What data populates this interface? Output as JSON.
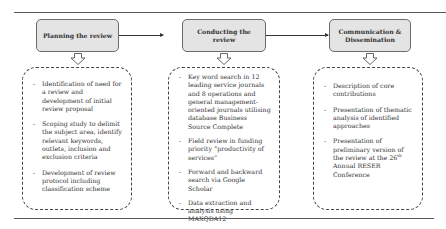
{
  "figure": {
    "phases": [
      {
        "id": "planning",
        "title": "Planning the review",
        "items": [
          "Identification of need for a review and development of initial review proposal",
          "Scoping study to delimit the subject area, identify relevant keywords, outlets, inclusion and exclusion criteria",
          "Development of review protocol including classification scheme"
        ]
      },
      {
        "id": "conducting",
        "title": "Conducting the review",
        "items": [
          "Key word search in 12 leading service journals and 8 operations and general management-oriented journals utilising database Business Source Complete",
          "Field review in funding priority “productivity of services”",
          "Forward and backward search via Google Scholar",
          "Data extraction and analysis using MAXQDA12"
        ]
      },
      {
        "id": "communication",
        "title": "Communication & Dissemination",
        "items": [
          "Description of core contributions",
          "Presentation of thematic analysis of identified approaches"
        ],
        "last_item": {
          "before": "Presentation of preliminary version of the review at the 26",
          "superscript": "th",
          "after": " Annual RESER Conference"
        }
      }
    ],
    "bullet_glyph": "-",
    "colors": {
      "phase_fill": "#e4e4e4",
      "phase_border": "#6b6b6b",
      "arrow_line": "#333333",
      "text": "#333333"
    }
  }
}
